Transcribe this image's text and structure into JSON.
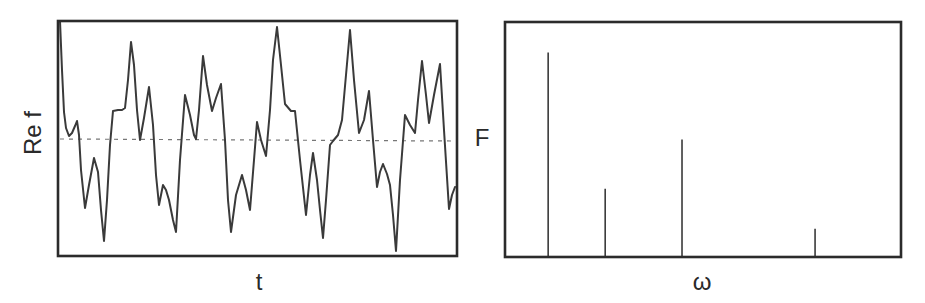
{
  "chart_data": [
    {
      "type": "line",
      "title": "",
      "xlabel": "t",
      "ylabel": "Re f",
      "grid": false,
      "legend": null,
      "ticks": {
        "x": [],
        "y": []
      },
      "reference_line": {
        "style": "dashed",
        "value": 0,
        "label": ""
      },
      "description": "Quasi-periodic real-valued signal Re f(t) built from a superposition of several sinusoids; dashed horizontal line marks zero.",
      "plot_box_px": {
        "x0": 58,
        "y0": 21,
        "x1": 457,
        "y1": 256
      },
      "zero_line_px": {
        "y_left": 139,
        "y_right": 141
      },
      "points_px": [
        [
          60,
          21
        ],
        [
          62,
          70
        ],
        [
          64,
          112
        ],
        [
          66,
          128
        ],
        [
          69,
          136
        ],
        [
          72,
          133
        ],
        [
          75,
          126
        ],
        [
          77,
          121
        ],
        [
          79,
          135
        ],
        [
          81,
          170
        ],
        [
          85,
          208
        ],
        [
          89,
          185
        ],
        [
          94,
          158
        ],
        [
          98,
          172
        ],
        [
          101,
          210
        ],
        [
          104,
          241
        ],
        [
          107,
          200
        ],
        [
          110,
          145
        ],
        [
          113,
          111
        ],
        [
          118,
          110
        ],
        [
          122,
          110
        ],
        [
          125,
          108
        ],
        [
          128,
          80
        ],
        [
          131,
          42
        ],
        [
          134,
          65
        ],
        [
          137,
          110
        ],
        [
          140,
          140
        ],
        [
          144,
          118
        ],
        [
          149,
          87
        ],
        [
          153,
          125
        ],
        [
          156,
          175
        ],
        [
          159,
          205
        ],
        [
          163,
          185
        ],
        [
          166,
          190
        ],
        [
          169,
          200
        ],
        [
          173,
          220
        ],
        [
          176,
          232
        ],
        [
          180,
          160
        ],
        [
          185,
          95
        ],
        [
          190,
          115
        ],
        [
          194,
          135
        ],
        [
          196,
          139
        ],
        [
          199,
          110
        ],
        [
          203,
          56
        ],
        [
          207,
          85
        ],
        [
          212,
          111
        ],
        [
          216,
          98
        ],
        [
          221,
          84
        ],
        [
          225,
          140
        ],
        [
          228,
          200
        ],
        [
          231,
          232
        ],
        [
          236,
          195
        ],
        [
          242,
          175
        ],
        [
          246,
          190
        ],
        [
          250,
          210
        ],
        [
          254,
          160
        ],
        [
          257,
          122
        ],
        [
          261,
          140
        ],
        [
          266,
          156
        ],
        [
          270,
          110
        ],
        [
          273,
          60
        ],
        [
          277,
          27
        ],
        [
          281,
          65
        ],
        [
          285,
          104
        ],
        [
          291,
          111
        ],
        [
          295,
          111
        ],
        [
          300,
          160
        ],
        [
          306,
          215
        ],
        [
          310,
          175
        ],
        [
          313,
          153
        ],
        [
          317,
          180
        ],
        [
          320,
          210
        ],
        [
          323,
          238
        ],
        [
          326,
          200
        ],
        [
          330,
          145
        ],
        [
          333,
          141
        ],
        [
          338,
          135
        ],
        [
          342,
          120
        ],
        [
          346,
          75
        ],
        [
          350,
          30
        ],
        [
          354,
          80
        ],
        [
          359,
          133
        ],
        [
          364,
          120
        ],
        [
          369,
          91
        ],
        [
          373,
          140
        ],
        [
          377,
          187
        ],
        [
          380,
          172
        ],
        [
          383,
          164
        ],
        [
          387,
          174
        ],
        [
          390,
          185
        ],
        [
          393,
          215
        ],
        [
          396,
          251
        ],
        [
          400,
          180
        ],
        [
          405,
          115
        ],
        [
          410,
          125
        ],
        [
          415,
          133
        ],
        [
          418,
          100
        ],
        [
          422,
          61
        ],
        [
          426,
          95
        ],
        [
          429,
          123
        ],
        [
          434,
          95
        ],
        [
          440,
          64
        ],
        [
          444,
          130
        ],
        [
          449,
          209
        ],
        [
          452,
          195
        ],
        [
          455,
          187
        ]
      ]
    },
    {
      "type": "bar",
      "subtype": "stem",
      "title": "",
      "xlabel": "ω",
      "ylabel": "F",
      "grid": false,
      "legend": null,
      "ticks": {
        "x": [],
        "y": []
      },
      "description": "Fourier spectrum of the signal: four discrete spectral lines.",
      "plot_box_px": {
        "x0": 505,
        "y0": 22,
        "x1": 901,
        "y1": 257
      },
      "x_relative": [
        0.109,
        0.253,
        0.447,
        0.783
      ],
      "values": [
        0.87,
        0.29,
        0.5,
        0.12
      ],
      "categories": [
        "ω1",
        "ω2",
        "ω3",
        "ω4"
      ],
      "ylim": [
        0,
        1
      ]
    }
  ],
  "panels": {
    "left": {
      "xlabel": "t",
      "ylabel": "Re f"
    },
    "right": {
      "xlabel": "ω",
      "ylabel": "F"
    }
  },
  "colors": {
    "axes": "#2b2b2b",
    "signal": "#3a3a3a",
    "zero_line": "#777777",
    "spectrum": "#3a3a3a",
    "background": "#ffffff"
  }
}
